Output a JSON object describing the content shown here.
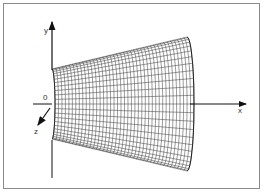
{
  "figure": {
    "type": "3d-wireframe-frustum",
    "axes": {
      "x_label": "x",
      "y_label": "y",
      "z_label": "z",
      "origin_label": "0"
    },
    "colors": {
      "frame": "#8a8a8a",
      "mesh": "#222222",
      "axis": "#111111"
    }
  }
}
